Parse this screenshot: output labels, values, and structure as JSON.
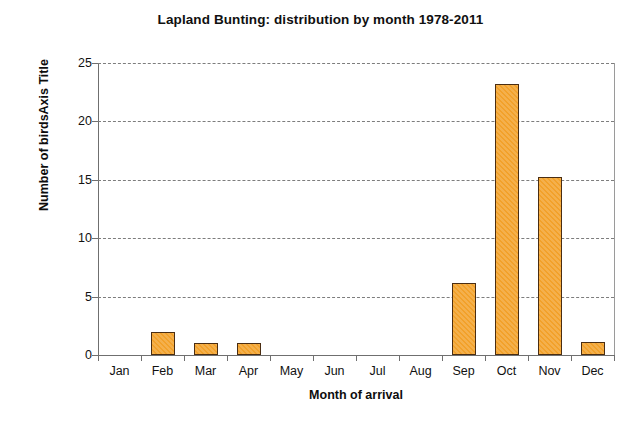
{
  "chart_data": {
    "type": "bar",
    "title": "Lapland Bunting: distribution by month 1978-2011",
    "xlabel": "Month of arrival",
    "ylabel": "Number of birdsAxis Title",
    "categories": [
      "Jan",
      "Feb",
      "Mar",
      "Apr",
      "May",
      "Jun",
      "Jul",
      "Aug",
      "Sep",
      "Oct",
      "Nov",
      "Dec"
    ],
    "values": [
      0,
      2.0,
      1.0,
      1.0,
      0,
      0,
      0,
      0,
      6.2,
      23.2,
      15.2,
      1.1
    ],
    "ylim": [
      0,
      25
    ],
    "yticks": [
      0,
      5,
      10,
      15,
      20,
      25
    ],
    "ytick_labels": [
      "0",
      "5",
      "10",
      "15",
      "20",
      "25"
    ],
    "grid": "horizontal-dashed",
    "legend": "none",
    "series_color": "#f2a12a",
    "series_border_color": "#4a2d12",
    "gridline_color": "#7d7d7d",
    "axis_color": "#6f6f6f"
  }
}
